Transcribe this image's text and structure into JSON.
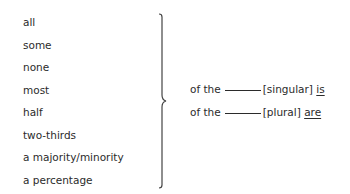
{
  "quantifiers": [
    "all",
    "some",
    "none",
    "most",
    "half",
    "two-thirds",
    "a majority/minority",
    "a percentage"
  ],
  "rules": [
    {
      "prefix": "of the",
      "type": "[singular]",
      "verb": "is"
    },
    {
      "prefix": "of the",
      "type": "[plural]",
      "verb": "are"
    }
  ],
  "colors": {
    "text": "#2b2b2b",
    "brace": "#444444",
    "background": "#ffffff"
  }
}
